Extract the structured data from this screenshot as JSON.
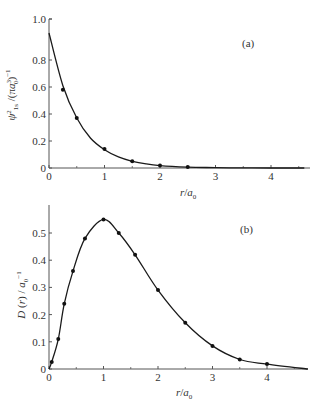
{
  "chart_data": [
    {
      "type": "line",
      "panel_label": "(a)",
      "title": "",
      "xlabel": "r/a0",
      "ylabel": "ψ²1s / (πa0³)⁻¹",
      "xlim": [
        0,
        4.7
      ],
      "ylim": [
        0,
        1.0
      ],
      "x_ticks": [
        "0",
        "1",
        "2",
        "3",
        "4"
      ],
      "y_ticks": [
        "0",
        "0.2",
        "0.4",
        "0.6",
        "0.8",
        "1.0"
      ],
      "grid": false,
      "legend": null,
      "series": [
        {
          "name": "curve",
          "style": "solid line",
          "x": [
            0,
            0.25,
            0.5,
            0.75,
            1.0,
            1.25,
            1.5,
            1.75,
            2.0,
            2.5,
            3.0,
            3.5,
            4.0,
            4.6
          ],
          "y": [
            1.0,
            0.61,
            0.37,
            0.22,
            0.135,
            0.082,
            0.05,
            0.03,
            0.018,
            0.007,
            0.0025,
            0.001,
            0.0003,
            0.0001
          ]
        },
        {
          "name": "points",
          "style": "markers",
          "x": [
            0.25,
            0.5,
            1.0,
            1.5,
            2.0,
            2.5
          ],
          "y": [
            0.58,
            0.37,
            0.14,
            0.05,
            0.018,
            0.007
          ]
        }
      ]
    },
    {
      "type": "line",
      "panel_label": "(b)",
      "title": "",
      "xlabel": "r/a0",
      "ylabel": "D(r) / a0⁻¹",
      "xlim": [
        0,
        4.8
      ],
      "ylim": [
        0,
        0.6
      ],
      "x_ticks": [
        "0",
        "1",
        "2",
        "3",
        "4"
      ],
      "y_ticks": [
        "0",
        "0.1",
        "0.2",
        "0.3",
        "0.4",
        "0.5"
      ],
      "grid": false,
      "legend": null,
      "series": [
        {
          "name": "curve",
          "style": "solid line",
          "x": [
            0,
            0.05,
            0.17,
            0.28,
            0.44,
            0.66,
            1.0,
            1.28,
            1.58,
            2.0,
            2.5,
            3.0,
            3.5,
            4.0,
            4.75
          ],
          "y": [
            0,
            0.026,
            0.11,
            0.24,
            0.36,
            0.48,
            0.55,
            0.5,
            0.42,
            0.29,
            0.17,
            0.085,
            0.035,
            0.018,
            0.0
          ]
        },
        {
          "name": "points",
          "style": "markers",
          "x": [
            0.05,
            0.17,
            0.28,
            0.44,
            0.66,
            1.0,
            1.28,
            1.58,
            2.0,
            2.5,
            3.0,
            3.5,
            4.0
          ],
          "y": [
            0.026,
            0.11,
            0.24,
            0.36,
            0.48,
            0.55,
            0.5,
            0.42,
            0.29,
            0.17,
            0.085,
            0.035,
            0.018
          ]
        }
      ]
    }
  ],
  "panels": {
    "a": {
      "label": "(a)",
      "xlabel_main": "r",
      "xlabel_sep": "/",
      "xlabel_var": "a",
      "xlabel_sub": "0",
      "ylabel": "ψ²1s /(πa0³)⁻¹",
      "x_ticks": [
        "0",
        "1",
        "2",
        "3",
        "4"
      ],
      "y_ticks": [
        "0",
        "0.2",
        "0.4",
        "0.6",
        "0.8",
        "1.0"
      ]
    },
    "b": {
      "label": "(b)",
      "xlabel_main": "r",
      "xlabel_sep": "/",
      "xlabel_var": "a",
      "xlabel_sub": "0",
      "ylabel": "D (r) / a0⁻¹",
      "x_ticks": [
        "0",
        "1",
        "2",
        "3",
        "4"
      ],
      "y_ticks": [
        "0",
        "0.1",
        "0.2",
        "0.3",
        "0.4",
        "0.5"
      ]
    }
  },
  "colors": {
    "line": "#1a1a1a",
    "axis": "#555555",
    "marker": "#111111"
  }
}
